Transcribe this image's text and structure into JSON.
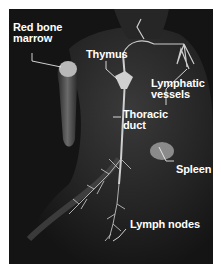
{
  "figure": {
    "background_color": "#141414",
    "label_color": "#ffffff",
    "labels": {
      "red_bone_marrow": {
        "line1": "Red bone",
        "line2": "marrow"
      },
      "thymus": {
        "text": "Thymus"
      },
      "lymphatic_vessels": {
        "line1": "Lymphatic",
        "line2": "vessels"
      },
      "thoracic_duct": {
        "line1": "Thoracic",
        "line2": "duct"
      },
      "spleen": {
        "text": "Spleen"
      },
      "lymph_nodes": {
        "text": "Lymph nodes"
      }
    }
  }
}
